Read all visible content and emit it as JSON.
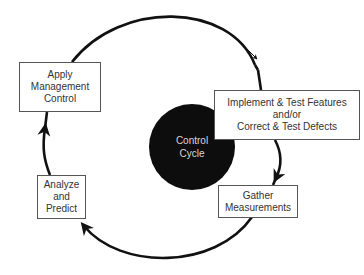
{
  "diagram": {
    "type": "cycle",
    "center": {
      "lines": [
        "Control",
        "Cycle"
      ],
      "fill": "#0d0d0d",
      "text_color": "#d8d8d8"
    },
    "nodes": [
      {
        "id": "apply",
        "lines": [
          "Apply",
          "Management",
          "Control"
        ]
      },
      {
        "id": "implement",
        "lines": [
          "Implement & Test Features",
          "and/or",
          "Correct & Test Defects"
        ]
      },
      {
        "id": "gather",
        "lines": [
          "Gather",
          "Measurements"
        ]
      },
      {
        "id": "analyze",
        "lines": [
          "Analyze",
          "and",
          "Predict"
        ]
      }
    ],
    "edges": [
      {
        "from": "apply",
        "to": "implement"
      },
      {
        "from": "implement",
        "to": "gather"
      },
      {
        "from": "gather",
        "to": "analyze"
      },
      {
        "from": "analyze",
        "to": "apply"
      }
    ],
    "colors": {
      "arrow": "#111111",
      "box_border": "#555555",
      "text": "#333333"
    }
  }
}
